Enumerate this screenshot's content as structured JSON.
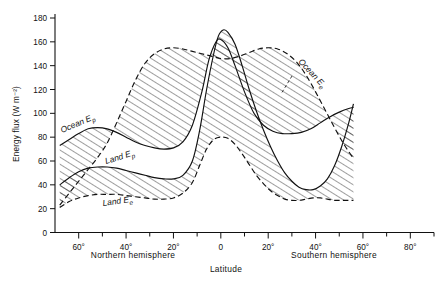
{
  "chart_data": {
    "type": "line",
    "title": "",
    "xlabel": "Latitude",
    "ylabel": "Energy flux (W m⁻²)",
    "ylim": [
      0,
      180
    ],
    "ytick_step": 20,
    "yticks": [
      "0",
      "20",
      "40",
      "60",
      "80",
      "100",
      "120",
      "140",
      "160",
      "180"
    ],
    "xlim_deg": [
      -70,
      90
    ],
    "xticks": [
      "60°",
      "40°",
      "20°",
      "0",
      "20°",
      "40°",
      "60°",
      "80°"
    ],
    "xtick_values": [
      -60,
      -40,
      -20,
      0,
      20,
      40,
      60,
      80
    ],
    "xminor_step_deg": 10,
    "grid": false,
    "legend_position": "inline-annotations",
    "hemisphere_labels": {
      "left": "Northern hemisphere",
      "right": "Southern hemisphere"
    },
    "annotations": [
      {
        "text": "Ocean Ep",
        "base": "Ocean E",
        "sub": "p",
        "x_px": 62,
        "y_px": 133,
        "rotation": -23
      },
      {
        "text": "Land Ep",
        "base": "Land E",
        "sub": "p",
        "x_px": 106,
        "y_px": 164,
        "rotation": -17
      },
      {
        "text": "Land Ee",
        "base": "Land E",
        "sub": "e",
        "x_px": 103,
        "y_px": 206,
        "rotation": -8
      },
      {
        "text": "Ocean Ee",
        "base": "Ocean E",
        "sub": "e",
        "x_px": 298,
        "y_px": 62,
        "rotation": 47
      }
    ],
    "series": [
      {
        "name": "Ocean Ep",
        "label_base": "Ocean E",
        "label_sub": "p",
        "linestyle": "solid",
        "points_deg_flux": [
          [
            -68,
            73
          ],
          [
            -64,
            78
          ],
          [
            -60,
            83
          ],
          [
            -56,
            87
          ],
          [
            -52,
            88
          ],
          [
            -48,
            87
          ],
          [
            -44,
            84
          ],
          [
            -40,
            80
          ],
          [
            -36,
            76
          ],
          [
            -32,
            73
          ],
          [
            -28,
            71
          ],
          [
            -24,
            70
          ],
          [
            -20,
            71
          ],
          [
            -16,
            76
          ],
          [
            -12,
            90
          ],
          [
            -8,
            118
          ],
          [
            -5,
            145
          ],
          [
            -2,
            160
          ],
          [
            0,
            162
          ],
          [
            3,
            155
          ],
          [
            6,
            140
          ],
          [
            10,
            118
          ],
          [
            14,
            100
          ],
          [
            18,
            90
          ],
          [
            22,
            85
          ],
          [
            26,
            83
          ],
          [
            30,
            83
          ],
          [
            34,
            84
          ],
          [
            38,
            87
          ],
          [
            42,
            92
          ],
          [
            46,
            97
          ],
          [
            50,
            101
          ],
          [
            54,
            104
          ],
          [
            56,
            105
          ]
        ]
      },
      {
        "name": "Ocean Ee",
        "label_base": "Ocean E",
        "label_sub": "e",
        "linestyle": "dashed",
        "points_deg_flux": [
          [
            -68,
            23
          ],
          [
            -64,
            33
          ],
          [
            -60,
            43
          ],
          [
            -56,
            53
          ],
          [
            -52,
            63
          ],
          [
            -48,
            75
          ],
          [
            -44,
            92
          ],
          [
            -40,
            110
          ],
          [
            -36,
            128
          ],
          [
            -32,
            142
          ],
          [
            -28,
            150
          ],
          [
            -24,
            154
          ],
          [
            -20,
            155
          ],
          [
            -16,
            154
          ],
          [
            -12,
            152
          ],
          [
            -8,
            150
          ],
          [
            -4,
            148
          ],
          [
            0,
            146
          ],
          [
            4,
            146
          ],
          [
            8,
            148
          ],
          [
            12,
            151
          ],
          [
            16,
            154
          ],
          [
            20,
            155
          ],
          [
            24,
            154
          ],
          [
            28,
            150
          ],
          [
            32,
            143
          ],
          [
            36,
            132
          ],
          [
            40,
            118
          ],
          [
            44,
            103
          ],
          [
            48,
            88
          ],
          [
            52,
            74
          ],
          [
            56,
            62
          ]
        ]
      },
      {
        "name": "Land Ep",
        "label_base": "Land E",
        "label_sub": "p",
        "linestyle": "solid",
        "points_deg_flux": [
          [
            -68,
            40
          ],
          [
            -64,
            46
          ],
          [
            -60,
            51
          ],
          [
            -56,
            54
          ],
          [
            -52,
            55
          ],
          [
            -48,
            55
          ],
          [
            -44,
            54
          ],
          [
            -40,
            52
          ],
          [
            -36,
            50
          ],
          [
            -32,
            48
          ],
          [
            -28,
            46
          ],
          [
            -24,
            45
          ],
          [
            -20,
            45
          ],
          [
            -16,
            48
          ],
          [
            -12,
            60
          ],
          [
            -9,
            85
          ],
          [
            -6,
            120
          ],
          [
            -3,
            150
          ],
          [
            -1,
            165
          ],
          [
            1,
            170
          ],
          [
            3,
            168
          ],
          [
            6,
            158
          ],
          [
            9,
            140
          ],
          [
            12,
            120
          ],
          [
            15,
            102
          ],
          [
            18,
            86
          ],
          [
            21,
            72
          ],
          [
            24,
            60
          ],
          [
            27,
            50
          ],
          [
            30,
            43
          ],
          [
            33,
            38
          ],
          [
            36,
            36
          ],
          [
            39,
            36
          ],
          [
            42,
            39
          ],
          [
            45,
            45
          ],
          [
            48,
            56
          ],
          [
            51,
            72
          ],
          [
            54,
            92
          ],
          [
            56,
            108
          ]
        ]
      },
      {
        "name": "Land Ee",
        "label_base": "Land E",
        "label_sub": "e",
        "linestyle": "dashed",
        "points_deg_flux": [
          [
            -68,
            21
          ],
          [
            -64,
            26
          ],
          [
            -60,
            29
          ],
          [
            -56,
            31
          ],
          [
            -52,
            32
          ],
          [
            -48,
            32
          ],
          [
            -44,
            32
          ],
          [
            -40,
            31
          ],
          [
            -36,
            30
          ],
          [
            -32,
            29
          ],
          [
            -28,
            28
          ],
          [
            -24,
            28
          ],
          [
            -20,
            29
          ],
          [
            -16,
            33
          ],
          [
            -12,
            42
          ],
          [
            -9,
            56
          ],
          [
            -6,
            70
          ],
          [
            -3,
            78
          ],
          [
            0,
            80
          ],
          [
            3,
            79
          ],
          [
            6,
            74
          ],
          [
            9,
            66
          ],
          [
            12,
            57
          ],
          [
            15,
            48
          ],
          [
            18,
            41
          ],
          [
            21,
            35
          ],
          [
            24,
            31
          ],
          [
            27,
            28
          ],
          [
            30,
            27
          ],
          [
            33,
            27
          ],
          [
            36,
            28
          ],
          [
            39,
            29
          ],
          [
            42,
            29
          ],
          [
            45,
            28
          ],
          [
            48,
            27
          ],
          [
            51,
            27
          ],
          [
            54,
            27
          ],
          [
            56,
            27
          ]
        ]
      }
    ],
    "bands": [
      {
        "name": "ocean-band",
        "upper": "Ocean Ee",
        "lower": "Ocean Ep",
        "hatched": true
      },
      {
        "name": "land-band",
        "upper": "Land Ep",
        "lower": "Land Ee",
        "hatched": true
      }
    ]
  }
}
